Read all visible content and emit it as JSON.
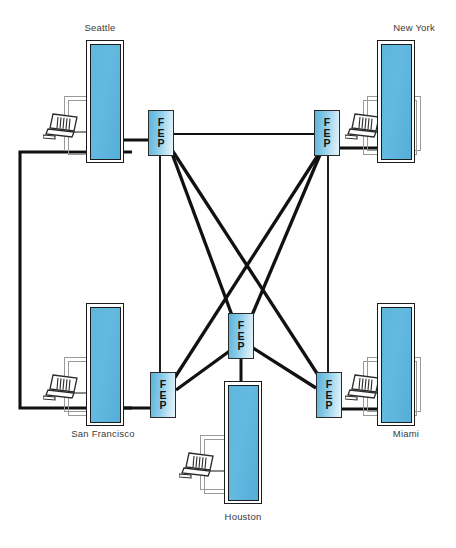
{
  "diagram": {
    "type": "network-topology",
    "canvas": {
      "width": 456,
      "height": 548
    },
    "colors": {
      "mainframe_fill": "#5fb7de",
      "mainframe_border": "#1b1b1b",
      "fep_fill_light": "#e7f5fb",
      "fep_fill_dark": "#5bb2dc",
      "fep_border": "#2b2b2b",
      "desk_outline": "#9a9a9a",
      "link_line": "#111111",
      "label_text": "#3a3a3a",
      "background": "#ffffff"
    },
    "node_label": "FEP",
    "node_letters": [
      "F",
      "E",
      "P"
    ],
    "sites": [
      {
        "id": "seattle",
        "label": "Seattle",
        "label_position": "above",
        "label_x": 69,
        "label_y": 22,
        "label_w": 62,
        "mainframe": {
          "x": 86,
          "y": 40,
          "w": 38,
          "h": 123
        },
        "desk": {
          "x": 64,
          "y": 96,
          "w": 54,
          "h": 55
        },
        "desk2": {
          "x": 68,
          "y": 100,
          "w": 54,
          "h": 55
        },
        "terminal": {
          "x": 43,
          "y": 112
        },
        "fep": {
          "x": 148,
          "y": 110,
          "w": 26,
          "h": 46
        }
      },
      {
        "id": "new-york",
        "label": "New York",
        "label_position": "above",
        "label_x": 383,
        "label_y": 22,
        "label_w": 62,
        "mainframe": {
          "x": 377,
          "y": 40,
          "w": 38,
          "h": 123
        },
        "desk": {
          "x": 367,
          "y": 96,
          "w": 54,
          "h": 55
        },
        "desk2": {
          "x": 363,
          "y": 100,
          "w": 54,
          "h": 55
        },
        "terminal": {
          "x": 345,
          "y": 112
        },
        "fep": {
          "x": 314,
          "y": 110,
          "w": 26,
          "h": 46
        }
      },
      {
        "id": "san-francisco",
        "label": "San Francisco",
        "label_position": "below",
        "label_x": 62,
        "label_y": 428,
        "label_w": 82,
        "mainframe": {
          "x": 86,
          "y": 303,
          "w": 38,
          "h": 123
        },
        "desk": {
          "x": 64,
          "y": 357,
          "w": 54,
          "h": 55
        },
        "desk2": {
          "x": 68,
          "y": 361,
          "w": 54,
          "h": 55
        },
        "terminal": {
          "x": 43,
          "y": 373
        },
        "fep": {
          "x": 150,
          "y": 372,
          "w": 26,
          "h": 46
        }
      },
      {
        "id": "miami",
        "label": "Miami",
        "label_position": "below",
        "label_x": 375,
        "label_y": 428,
        "label_w": 62,
        "mainframe": {
          "x": 377,
          "y": 303,
          "w": 38,
          "h": 123
        },
        "desk": {
          "x": 367,
          "y": 357,
          "w": 54,
          "h": 55
        },
        "desk2": {
          "x": 363,
          "y": 361,
          "w": 54,
          "h": 55
        },
        "terminal": {
          "x": 345,
          "y": 373
        },
        "fep": {
          "x": 316,
          "y": 372,
          "w": 26,
          "h": 46
        }
      },
      {
        "id": "houston",
        "label": "Houston",
        "label_position": "below",
        "label_x": 212,
        "label_y": 511,
        "label_w": 62,
        "mainframe": {
          "x": 224,
          "y": 381,
          "w": 38,
          "h": 123
        },
        "desk": {
          "x": 200,
          "y": 435,
          "w": 54,
          "h": 55
        },
        "desk2": {
          "x": 204,
          "y": 439,
          "w": 54,
          "h": 55
        },
        "terminal": {
          "x": 179,
          "y": 451
        },
        "fep": {
          "x": 228,
          "y": 313,
          "w": 26,
          "h": 46
        }
      }
    ],
    "links": [
      {
        "from": "seattle-fep",
        "to": "new-york-fep",
        "style": "thin-horizontal"
      },
      {
        "from": "seattle-fep",
        "to": "san-francisco-fep",
        "style": "thin-vertical"
      },
      {
        "from": "new-york-fep",
        "to": "miami-fep",
        "style": "thin-vertical"
      },
      {
        "from": "seattle-fep",
        "to": "houston-fep",
        "style": "thick-diagonal"
      },
      {
        "from": "seattle-fep",
        "to": "miami-fep",
        "style": "thick-diagonal"
      },
      {
        "from": "new-york-fep",
        "to": "houston-fep",
        "style": "thick-diagonal"
      },
      {
        "from": "new-york-fep",
        "to": "san-francisco-fep",
        "style": "thick-diagonal"
      },
      {
        "from": "san-francisco-fep",
        "to": "houston-fep",
        "style": "thick-diagonal"
      },
      {
        "from": "miami-fep",
        "to": "houston-fep",
        "style": "thick-diagonal"
      },
      {
        "from": "houston-fep",
        "to": "houston-mainframe",
        "style": "thick-vertical"
      },
      {
        "from": "seattle-mainframe",
        "to": "san-francisco-mainframe",
        "style": "thick-left-loop"
      },
      {
        "from": "seattle-mainframe",
        "to": "seattle-fep",
        "style": "thick-stub"
      },
      {
        "from": "new-york-fep",
        "to": "new-york-mainframe",
        "style": "thick-stub"
      },
      {
        "from": "san-francisco-mainframe",
        "to": "san-francisco-fep",
        "style": "thick-stub"
      },
      {
        "from": "miami-fep",
        "to": "miami-mainframe",
        "style": "thick-stub"
      }
    ]
  }
}
